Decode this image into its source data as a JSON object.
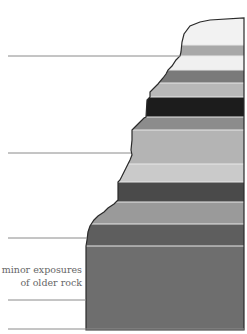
{
  "diagram": {
    "type": "stratigraphic-cross-section",
    "caption": {
      "line1": "minor exposures",
      "line2": "of older rock"
    },
    "colors": {
      "background": "#ffffff",
      "outline": "#2a2a2a",
      "guide_line": "#8a8a8a",
      "band_separator": "#e8e8e8"
    },
    "bands": [
      {
        "name": "cap-layer",
        "top": 18,
        "bottom": 45,
        "color": "#f2f2f2"
      },
      {
        "name": "layer-2",
        "top": 45,
        "bottom": 56,
        "color": "#a8a8a8"
      },
      {
        "name": "layer-3",
        "top": 56,
        "bottom": 70,
        "color": "#f0f0f0"
      },
      {
        "name": "layer-4",
        "top": 70,
        "bottom": 83,
        "color": "#7a7a7a"
      },
      {
        "name": "layer-5",
        "top": 83,
        "bottom": 97,
        "color": "#b8b8b8"
      },
      {
        "name": "layer-6",
        "top": 97,
        "bottom": 117,
        "color": "#1c1c1c"
      },
      {
        "name": "layer-7",
        "top": 117,
        "bottom": 130,
        "color": "#8c8c8c"
      },
      {
        "name": "layer-8",
        "top": 130,
        "bottom": 164,
        "color": "#b4b4b4"
      },
      {
        "name": "layer-9",
        "top": 164,
        "bottom": 182,
        "color": "#cacaca"
      },
      {
        "name": "layer-10",
        "top": 182,
        "bottom": 202,
        "color": "#4a4a4a"
      },
      {
        "name": "layer-11",
        "top": 202,
        "bottom": 224,
        "color": "#9a9a9a"
      },
      {
        "name": "layer-12",
        "top": 224,
        "bottom": 246,
        "color": "#5e5e5e"
      },
      {
        "name": "older-rock",
        "top": 246,
        "bottom": 330,
        "color": "#6e6e6e"
      }
    ],
    "guide_lines": [
      {
        "y": 56,
        "x1": 8,
        "x2": 180
      },
      {
        "y": 153,
        "x1": 8,
        "x2": 131
      },
      {
        "y": 238,
        "x1": 8,
        "x2": 87
      },
      {
        "y": 300,
        "x1": 8,
        "x2": 86
      },
      {
        "y": 329,
        "x1": 8,
        "x2": 244
      }
    ]
  }
}
